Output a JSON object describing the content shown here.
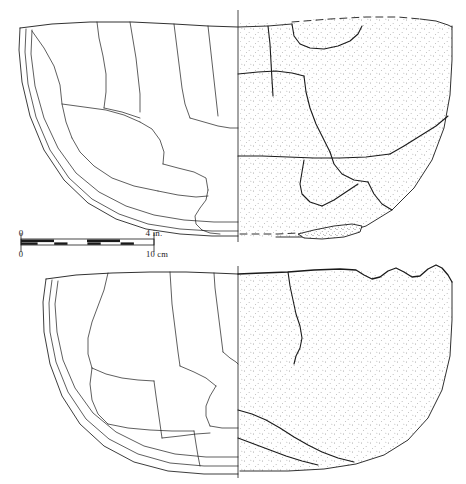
{
  "figure": {
    "type": "archaeological-pottery-plate",
    "background_color": "#ffffff",
    "ink_color": "#1a1a1a",
    "stipple_color": "#3a3a3a"
  },
  "scale_bar": {
    "name": "dual-scale-bar",
    "imperial": {
      "start_label": "0",
      "end_label": "4 in.",
      "units": "inches",
      "max": 4,
      "divisions": 4
    },
    "metric": {
      "start_label": "0",
      "end_label": "10 cm",
      "units": "centimeters",
      "max": 10,
      "divisions": 10
    }
  },
  "vessels": [
    {
      "id": "vessel-upper",
      "label": "upper vessel",
      "form": "open bowl with everted rim and rounded base",
      "left_half": "line-drawn cross-section with sherd break lines",
      "right_half": "stippled exterior elevation",
      "reconstruction": "dashed lines at rim and base"
    },
    {
      "id": "vessel-lower",
      "label": "lower vessel",
      "form": "deep hemispherical bowl with chipped rim",
      "left_half": "line-drawn cross-section with sherd break lines",
      "right_half": "stippled exterior elevation",
      "reconstruction": "none"
    }
  ]
}
